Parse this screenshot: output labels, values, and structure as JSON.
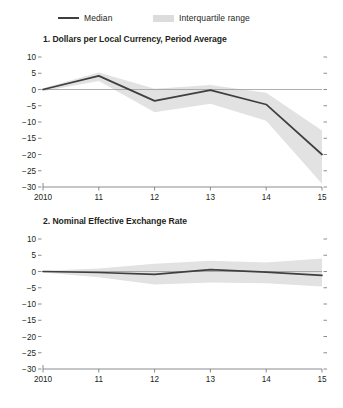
{
  "legend": {
    "items": [
      {
        "key": "median",
        "label": "Median",
        "marker": "line-swatch",
        "color": "#3f3f3f"
      },
      {
        "key": "iqr",
        "label": "Interquartile range",
        "marker": "band-swatch",
        "color": "#dcdcdc"
      }
    ]
  },
  "colors": {
    "median_line": "#3f3f3f",
    "band_fill": "#e2e2e2",
    "axis": "#6d6e71",
    "zero_line": "#9a9a9a",
    "text": "#231f20",
    "background": "#ffffff"
  },
  "chart_data": [
    {
      "type": "line",
      "panel_number": "1",
      "title": "1. Dollars per Local Currency, Period Average",
      "xlabel": "",
      "ylabel": "",
      "x": [
        2010,
        2011,
        2012,
        2013,
        2014,
        2015
      ],
      "xtick_labels": [
        "2010",
        "11",
        "12",
        "13",
        "14",
        "15"
      ],
      "ytick_labels": [
        "10",
        "5",
        "0",
        "−5",
        "−10",
        "−15",
        "−20",
        "−25",
        "−30"
      ],
      "ytick_values": [
        10,
        5,
        0,
        -5,
        -10,
        -15,
        -20,
        -25,
        -30
      ],
      "ylim": [
        -30,
        10
      ],
      "xlim": [
        2010,
        2015
      ],
      "grid": false,
      "zero_reference_line": true,
      "legend_position": "above-figure",
      "series": [
        {
          "name": "Median",
          "values": [
            0.0,
            4.2,
            -3.5,
            -0.2,
            -4.6,
            -20.0
          ]
        },
        {
          "name": "Interquartile range upper",
          "values": [
            0.4,
            5.2,
            0.2,
            1.4,
            -1.0,
            -12.6
          ]
        },
        {
          "name": "Interquartile range lower",
          "values": [
            -0.5,
            2.6,
            -7.0,
            -4.4,
            -9.6,
            -29.0
          ]
        }
      ]
    },
    {
      "type": "line",
      "panel_number": "2",
      "title": "2. Nominal Effective Exchange Rate",
      "xlabel": "",
      "ylabel": "",
      "x": [
        2010,
        2011,
        2012,
        2013,
        2014,
        2015
      ],
      "xtick_labels": [
        "2010",
        "11",
        "12",
        "13",
        "14",
        "15"
      ],
      "ytick_labels": [
        "10",
        "5",
        "0",
        "−5",
        "−10",
        "−15",
        "−20",
        "−25",
        "−30"
      ],
      "ytick_values": [
        10,
        5,
        0,
        -5,
        -10,
        -15,
        -20,
        -25,
        -30
      ],
      "ylim": [
        -30,
        10
      ],
      "xlim": [
        2010,
        2015
      ],
      "grid": false,
      "zero_reference_line": true,
      "legend_position": "above-figure",
      "series": [
        {
          "name": "Median",
          "values": [
            0.0,
            -0.3,
            -0.9,
            0.6,
            -0.2,
            -1.2
          ]
        },
        {
          "name": "Interquartile range upper",
          "values": [
            0.2,
            0.9,
            2.4,
            3.3,
            2.8,
            4.0
          ]
        },
        {
          "name": "Interquartile range lower",
          "values": [
            -0.3,
            -1.8,
            -4.0,
            -3.4,
            -3.6,
            -4.6
          ]
        }
      ]
    }
  ]
}
